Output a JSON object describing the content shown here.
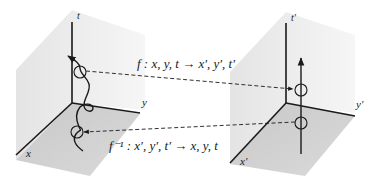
{
  "diagram": {
    "left_space": {
      "axes": {
        "t": "t",
        "y": "y",
        "x": "x"
      }
    },
    "right_space": {
      "axes": {
        "t": "t′",
        "y": "y′",
        "x": "x′"
      }
    },
    "forward_map": {
      "label": "f : x, y, t → x′, y′, t′"
    },
    "inverse_map": {
      "label": "f⁻¹ : x′, y′, t′ → x, y, t"
    }
  },
  "colors": {
    "wall": "#ececec",
    "floor": "#cfcfcf",
    "ink": "#1a1a1a"
  }
}
